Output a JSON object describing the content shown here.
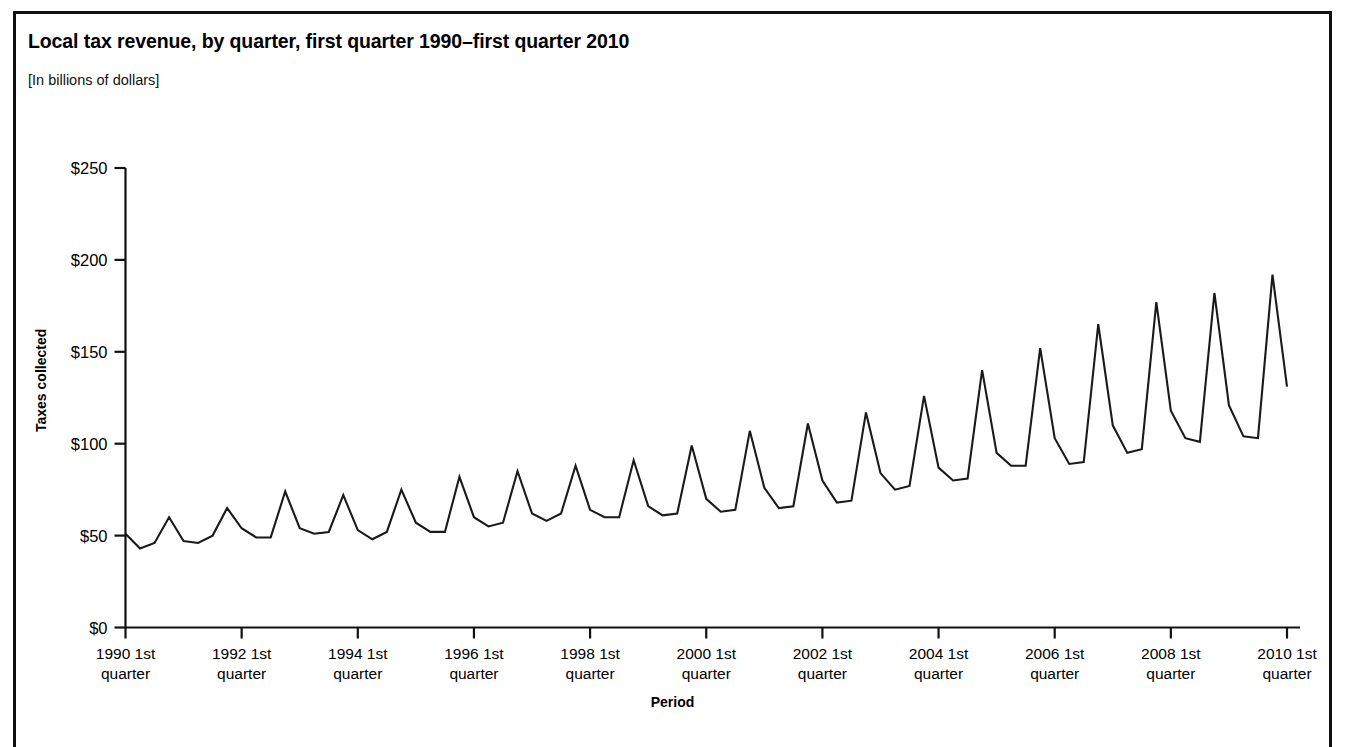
{
  "figure": {
    "title": "Local tax revenue, by quarter, first quarter 1990–first quarter 2010",
    "subtitle": "[In billions of dollars]"
  },
  "axes": {
    "y_title": "Taxes collected",
    "x_title": "Period"
  },
  "chart_data": {
    "type": "line",
    "title": "Local tax revenue, by quarter, first quarter 1990–first quarter 2010",
    "subtitle": "[In billions of dollars]",
    "xlabel": "Period",
    "ylabel": "Taxes collected",
    "ylim": [
      0,
      250
    ],
    "yticks": [
      0,
      50,
      100,
      150,
      200,
      250
    ],
    "ytick_labels": [
      "$0",
      "$50",
      "$100",
      "$150",
      "$200",
      "$250"
    ],
    "grid": false,
    "legend": false,
    "xtick_labels": [
      "1990 1st\nquarter",
      "1992 1st\nquarter",
      "1994 1st\nquarter",
      "1996 1st\nquarter",
      "1998 1st\nquarter",
      "2000 1st\nquarter",
      "2002 1st\nquarter",
      "2004 1st\nquarter",
      "2006 1st\nquarter",
      "2008 1st\nquarter",
      "2010 1st\nquarter"
    ],
    "xtick_years": [
      1990,
      1992,
      1994,
      1996,
      1998,
      2000,
      2002,
      2004,
      2006,
      2008,
      2010
    ],
    "xtick_indices": [
      0,
      8,
      16,
      24,
      32,
      40,
      48,
      56,
      64,
      72,
      80
    ],
    "x_quarters": [
      "1990 Q1",
      "1990 Q2",
      "1990 Q3",
      "1990 Q4",
      "1991 Q1",
      "1991 Q2",
      "1991 Q3",
      "1991 Q4",
      "1992 Q1",
      "1992 Q2",
      "1992 Q3",
      "1992 Q4",
      "1993 Q1",
      "1993 Q2",
      "1993 Q3",
      "1993 Q4",
      "1994 Q1",
      "1994 Q2",
      "1994 Q3",
      "1994 Q4",
      "1995 Q1",
      "1995 Q2",
      "1995 Q3",
      "1995 Q4",
      "1996 Q1",
      "1996 Q2",
      "1996 Q3",
      "1996 Q4",
      "1997 Q1",
      "1997 Q2",
      "1997 Q3",
      "1997 Q4",
      "1998 Q1",
      "1998 Q2",
      "1998 Q3",
      "1998 Q4",
      "1999 Q1",
      "1999 Q2",
      "1999 Q3",
      "1999 Q4",
      "2000 Q1",
      "2000 Q2",
      "2000 Q3",
      "2000 Q4",
      "2001 Q1",
      "2001 Q2",
      "2001 Q3",
      "2001 Q4",
      "2002 Q1",
      "2002 Q2",
      "2002 Q3",
      "2002 Q4",
      "2003 Q1",
      "2003 Q2",
      "2003 Q3",
      "2003 Q4",
      "2004 Q1",
      "2004 Q2",
      "2004 Q3",
      "2004 Q4",
      "2005 Q1",
      "2005 Q2",
      "2005 Q3",
      "2005 Q4",
      "2006 Q1",
      "2006 Q2",
      "2006 Q3",
      "2006 Q4",
      "2007 Q1",
      "2007 Q2",
      "2007 Q3",
      "2007 Q4",
      "2008 Q1",
      "2008 Q2",
      "2008 Q3",
      "2008 Q4",
      "2009 Q1",
      "2009 Q2",
      "2009 Q3",
      "2009 Q4",
      "2010 Q1"
    ],
    "values": [
      51,
      43,
      46,
      60,
      47,
      46,
      50,
      65,
      54,
      49,
      49,
      74,
      54,
      51,
      52,
      72,
      53,
      48,
      52,
      75,
      57,
      52,
      52,
      82,
      60,
      55,
      57,
      85,
      62,
      58,
      62,
      88,
      64,
      60,
      60,
      91,
      66,
      61,
      62,
      99,
      70,
      63,
      64,
      107,
      76,
      65,
      66,
      111,
      80,
      68,
      69,
      117,
      84,
      75,
      77,
      126,
      87,
      80,
      81,
      140,
      95,
      88,
      88,
      152,
      103,
      89,
      90,
      165,
      110,
      95,
      97,
      177,
      118,
      103,
      101,
      182,
      121,
      104,
      103,
      192,
      131
    ]
  }
}
